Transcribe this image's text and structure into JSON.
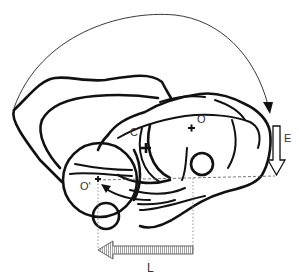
{
  "diagram": {
    "labels": {
      "center_c": "C",
      "center_o": "O",
      "center_o_prime": "O'",
      "arrow_e": "E",
      "arrow_l": "L"
    },
    "colors": {
      "stroke": "#111111",
      "background": "#ffffff",
      "guide_line": "#555555"
    },
    "arrows": {
      "rotation_arc": "clockwise arc from upper-left to right",
      "vertical_translation": "downward hollow arrow labeled E",
      "horizontal_translation": "leftward hatched arrow labeled L",
      "inner_curved_arrow": "arrow toward O'"
    }
  }
}
